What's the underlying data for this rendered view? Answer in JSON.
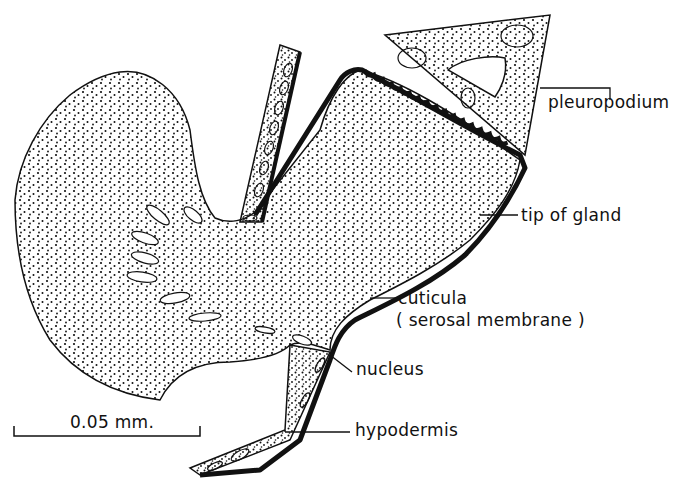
{
  "figure": {
    "labels": {
      "pleuropodium": "pleuropodium",
      "tip_of_gland": "tip of gland",
      "cuticula": "cuticula",
      "serosal_membrane": "( serosal membrane )",
      "nucleus": "nucleus",
      "hypodermis": "hypodermis"
    },
    "scale_bar": {
      "label": "0.05 mm."
    },
    "colors": {
      "ink": "#111111",
      "background": "#ffffff"
    }
  }
}
